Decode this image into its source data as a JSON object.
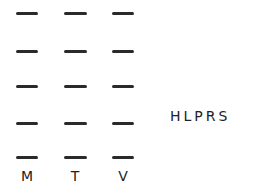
{
  "puzzle": {
    "columns": [
      {
        "x": 16,
        "width": 22
      },
      {
        "x": 64,
        "width": 23
      },
      {
        "x": 112,
        "width": 22
      }
    ],
    "rows": [
      {
        "y": 12
      },
      {
        "y": 50
      },
      {
        "y": 85
      },
      {
        "y": 122
      },
      {
        "y": 156
      }
    ],
    "revealed_letters": [
      "M",
      "T",
      "V"
    ],
    "letter_pool": "HLPRS"
  }
}
